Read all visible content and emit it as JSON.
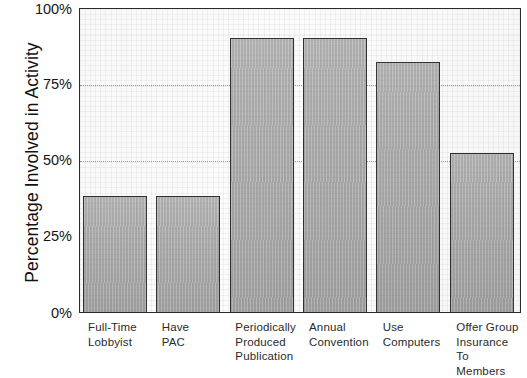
{
  "chart_data": {
    "type": "bar",
    "title": "",
    "xlabel": "",
    "ylabel": "Percentage Involved in Activity",
    "categories": [
      "Full-Time\nLobbyist",
      "Have\nPAC",
      "Periodically\nProduced\nPublication",
      "Annual\nConvention",
      "Use\nComputers",
      "Offer Group\nInsurance\nTo Members"
    ],
    "values": [
      38,
      38,
      90,
      90,
      82,
      52
    ],
    "ylim": [
      0,
      100
    ],
    "ytick_labels": [
      "100%",
      "75%",
      "50%",
      "25%",
      "0%"
    ],
    "ytick_values": [
      100,
      75,
      50,
      25,
      0
    ],
    "gridlines_at": [
      75,
      50
    ],
    "grid": true,
    "legend": "none",
    "series": [
      {
        "name": "Percentage Involved in Activity",
        "values": [
          38,
          38,
          90,
          90,
          82,
          52
        ]
      }
    ]
  },
  "style": {
    "bar_fill": "#adadad",
    "bar_border": "#2e2e2e",
    "frame": "#2b2b2b",
    "gridline": "#9a9a9a",
    "plot_background": "#fbfbfb",
    "text": "#1a1a1a"
  }
}
